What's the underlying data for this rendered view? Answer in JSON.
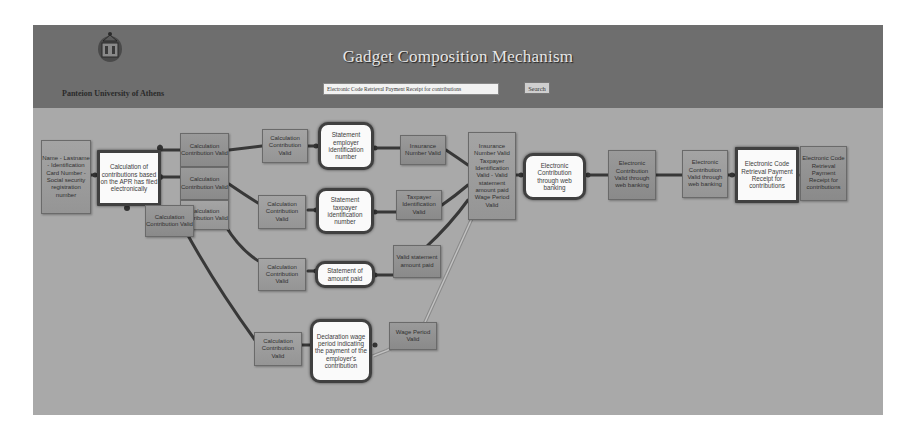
{
  "header": {
    "title": "Gadget Composition Mechanism",
    "university": "Panteion University of Athens",
    "logo_icon": "university-seal-icon",
    "search": {
      "value": "Electronic Code Retrieval Payment Receipt for contributions",
      "button_label": "Search"
    }
  },
  "colors": {
    "header_bg": "#6e6e6e",
    "canvas_bg": "#a9a9a9",
    "valid_box": "#929292",
    "gadget_box": "#fafafa",
    "edge": "#3a3a3a"
  },
  "diagram": {
    "inputs": {
      "personal_data": "Name - Lastname - Identification Card Number - Social security registration number"
    },
    "gadgets": {
      "calc_contributions": "Calculation of contributions based on the APR has filed electronically",
      "statement_employer": "Statement employer identification number",
      "statement_taxpayer": "Statement taxpayer identification number",
      "statement_amount": "Statement of amount paid",
      "declaration_wage": "Declaration wage period indicating the payment of the employer's contribution",
      "electronic_contribution": "Electronic Contribution through web banking",
      "electronic_code": "Electronic Code Retrieval Payment Receipt for contributions"
    },
    "valid_boxes": {
      "calc_valid_1": "Calculation Contribution Valid",
      "calc_valid_2": "Calculation Contribution Valid",
      "calc_valid_3": "Calculation Contribution Valid",
      "calc_valid_4": "Calculation Contribution Valid",
      "calc_valid_5": "Calculation Contribution Valid",
      "calc_valid_6": "Calculation Contribution Valid",
      "calc_valid_7": "Calculation Contribution Valid",
      "calc_valid_8": "Calculation Contribution Valid",
      "insurance_valid": "Insurance Number Valid",
      "taxpayer_valid": "Taxpayer Identification Valid",
      "amount_valid": "Valid statement amount paid",
      "wage_valid": "Wage Period Valid",
      "combined_valid": "Insurance Number Valid Taxpayer Identification Valid - Valid statement amount paid Wage Period Valid",
      "web_valid_1": "Electronic Contribution Valid through web banking",
      "web_valid_2": "Electronic Contribution Valid through web banking",
      "output": "Electronic Code Retrieval Payment Receipt for contributions"
    }
  }
}
